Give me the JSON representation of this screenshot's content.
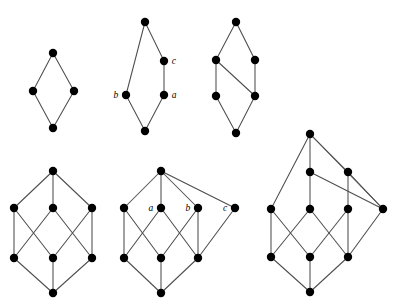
{
  "figure": {
    "background_color": "#ffffff",
    "vertex_color": "#000000",
    "edge_color": "#4d4d4d",
    "vertex_radius": 4.2,
    "width": 397,
    "height": 302,
    "diagrams": [
      {
        "id": "diagram-1",
        "name": "diamond-lattice",
        "position": "top-left",
        "vertex_count": 4,
        "edge_count": 4,
        "vertices": [
          {
            "id": "v1",
            "x": 53,
            "y": 53,
            "label": "",
            "label_side": ""
          },
          {
            "id": "v2",
            "x": 33,
            "y": 91,
            "label": "",
            "label_side": ""
          },
          {
            "id": "v3",
            "x": 74,
            "y": 91,
            "label": "",
            "label_side": ""
          },
          {
            "id": "v4",
            "x": 53,
            "y": 128,
            "label": "",
            "label_side": ""
          }
        ],
        "edges": [
          [
            "v1",
            "v2"
          ],
          [
            "v1",
            "v3"
          ],
          [
            "v2",
            "v4"
          ],
          [
            "v3",
            "v4"
          ]
        ]
      },
      {
        "id": "diagram-2",
        "name": "labelled-pentagon-lattice",
        "position": "top-center",
        "vertex_count": 5,
        "edge_count": 5,
        "vertices": [
          {
            "id": "v1",
            "x": 145,
            "y": 22,
            "label": "",
            "label_side": ""
          },
          {
            "id": "v2",
            "x": 164,
            "y": 61,
            "label": "c",
            "label_side": "right"
          },
          {
            "id": "v3",
            "x": 126,
            "y": 95,
            "label": "b",
            "label_side": "left"
          },
          {
            "id": "v4",
            "x": 164,
            "y": 95,
            "label": "a",
            "label_side": "right"
          },
          {
            "id": "v5",
            "x": 145,
            "y": 131,
            "label": "",
            "label_side": ""
          }
        ],
        "edges": [
          [
            "v1",
            "v2"
          ],
          [
            "v1",
            "v3"
          ],
          [
            "v2",
            "v4"
          ],
          [
            "v3",
            "v5"
          ],
          [
            "v4",
            "v5"
          ]
        ]
      },
      {
        "id": "diagram-3",
        "name": "six-element-lattice",
        "position": "top-right",
        "vertex_count": 6,
        "edge_count": 7,
        "vertices": [
          {
            "id": "v1",
            "x": 236,
            "y": 22,
            "label": "",
            "label_side": ""
          },
          {
            "id": "v2",
            "x": 216,
            "y": 60,
            "label": "",
            "label_side": ""
          },
          {
            "id": "v3",
            "x": 255,
            "y": 60,
            "label": "",
            "label_side": ""
          },
          {
            "id": "v4",
            "x": 216,
            "y": 96,
            "label": "",
            "label_side": ""
          },
          {
            "id": "v5",
            "x": 255,
            "y": 96,
            "label": "",
            "label_side": ""
          },
          {
            "id": "v6",
            "x": 236,
            "y": 133,
            "label": "",
            "label_side": ""
          }
        ],
        "edges": [
          [
            "v1",
            "v2"
          ],
          [
            "v1",
            "v3"
          ],
          [
            "v2",
            "v4"
          ],
          [
            "v2",
            "v5"
          ],
          [
            "v3",
            "v5"
          ],
          [
            "v4",
            "v6"
          ],
          [
            "v5",
            "v6"
          ]
        ]
      },
      {
        "id": "diagram-4",
        "name": "boolean-cube-lattice",
        "position": "bottom-left",
        "vertex_count": 8,
        "edge_count": 12,
        "vertices": [
          {
            "id": "t",
            "x": 53,
            "y": 171,
            "label": "",
            "label_side": ""
          },
          {
            "id": "m1",
            "x": 14,
            "y": 208,
            "label": "",
            "label_side": ""
          },
          {
            "id": "m2",
            "x": 53,
            "y": 208,
            "label": "",
            "label_side": ""
          },
          {
            "id": "m3",
            "x": 92,
            "y": 208,
            "label": "",
            "label_side": ""
          },
          {
            "id": "n1",
            "x": 14,
            "y": 258,
            "label": "",
            "label_side": ""
          },
          {
            "id": "n2",
            "x": 53,
            "y": 258,
            "label": "",
            "label_side": ""
          },
          {
            "id": "n3",
            "x": 92,
            "y": 258,
            "label": "",
            "label_side": ""
          },
          {
            "id": "b",
            "x": 53,
            "y": 293,
            "label": "",
            "label_side": ""
          }
        ],
        "edges": [
          [
            "t",
            "m1"
          ],
          [
            "t",
            "m2"
          ],
          [
            "t",
            "m3"
          ],
          [
            "m1",
            "n1"
          ],
          [
            "m1",
            "n2"
          ],
          [
            "m2",
            "n1"
          ],
          [
            "m2",
            "n3"
          ],
          [
            "m3",
            "n2"
          ],
          [
            "m3",
            "n3"
          ],
          [
            "n1",
            "b"
          ],
          [
            "n2",
            "b"
          ],
          [
            "n3",
            "b"
          ]
        ]
      },
      {
        "id": "diagram-5",
        "name": "labelled-cube-with-extra-atom",
        "position": "bottom-center",
        "vertex_count": 9,
        "edge_count": 14,
        "vertices": [
          {
            "id": "t",
            "x": 161,
            "y": 171,
            "label": "",
            "label_side": ""
          },
          {
            "id": "m1",
            "x": 124,
            "y": 208,
            "label": "",
            "label_side": ""
          },
          {
            "id": "m2",
            "x": 161,
            "y": 208,
            "label": "a",
            "label_side": "left"
          },
          {
            "id": "m3",
            "x": 198,
            "y": 208,
            "label": "b",
            "label_side": "left"
          },
          {
            "id": "m4",
            "x": 235,
            "y": 208,
            "label": "c",
            "label_side": "left"
          },
          {
            "id": "n1",
            "x": 124,
            "y": 258,
            "label": "",
            "label_side": ""
          },
          {
            "id": "n2",
            "x": 161,
            "y": 258,
            "label": "",
            "label_side": ""
          },
          {
            "id": "n3",
            "x": 198,
            "y": 258,
            "label": "",
            "label_side": ""
          },
          {
            "id": "b",
            "x": 161,
            "y": 293,
            "label": "",
            "label_side": ""
          }
        ],
        "edges": [
          [
            "t",
            "m1"
          ],
          [
            "t",
            "m2"
          ],
          [
            "t",
            "m3"
          ],
          [
            "t",
            "m4"
          ],
          [
            "m1",
            "n1"
          ],
          [
            "m1",
            "n2"
          ],
          [
            "m2",
            "n1"
          ],
          [
            "m2",
            "n3"
          ],
          [
            "m3",
            "n2"
          ],
          [
            "m3",
            "n3"
          ],
          [
            "m4",
            "n3"
          ],
          [
            "n1",
            "b"
          ],
          [
            "n2",
            "b"
          ],
          [
            "n3",
            "b"
          ]
        ]
      },
      {
        "id": "diagram-6",
        "name": "ten-element-lattice",
        "position": "bottom-right",
        "vertex_count": 10,
        "edge_count": 16,
        "vertices": [
          {
            "id": "t",
            "x": 310,
            "y": 134,
            "label": "",
            "label_side": ""
          },
          {
            "id": "p1",
            "x": 310,
            "y": 172,
            "label": "",
            "label_side": ""
          },
          {
            "id": "p2",
            "x": 348,
            "y": 172,
            "label": "",
            "label_side": ""
          },
          {
            "id": "m1",
            "x": 271,
            "y": 209,
            "label": "",
            "label_side": ""
          },
          {
            "id": "m2",
            "x": 310,
            "y": 209,
            "label": "",
            "label_side": ""
          },
          {
            "id": "m3",
            "x": 348,
            "y": 209,
            "label": "",
            "label_side": ""
          },
          {
            "id": "m4",
            "x": 383,
            "y": 209,
            "label": "",
            "label_side": ""
          },
          {
            "id": "n1",
            "x": 271,
            "y": 257,
            "label": "",
            "label_side": ""
          },
          {
            "id": "n2",
            "x": 310,
            "y": 257,
            "label": "",
            "label_side": ""
          },
          {
            "id": "n3",
            "x": 348,
            "y": 257,
            "label": "",
            "label_side": ""
          },
          {
            "id": "b",
            "x": 310,
            "y": 292,
            "label": "",
            "label_side": ""
          }
        ],
        "edges": [
          [
            "t",
            "m1"
          ],
          [
            "t",
            "p1"
          ],
          [
            "t",
            "p2"
          ],
          [
            "t",
            "m4"
          ],
          [
            "p1",
            "m2"
          ],
          [
            "p1",
            "m4"
          ],
          [
            "p2",
            "m3"
          ],
          [
            "p2",
            "m4"
          ],
          [
            "m1",
            "n1"
          ],
          [
            "m1",
            "n2"
          ],
          [
            "m2",
            "n1"
          ],
          [
            "m2",
            "n3"
          ],
          [
            "m3",
            "n2"
          ],
          [
            "m3",
            "n3"
          ],
          [
            "m4",
            "n3"
          ],
          [
            "n1",
            "b"
          ],
          [
            "n2",
            "b"
          ],
          [
            "n3",
            "b"
          ]
        ]
      }
    ]
  }
}
